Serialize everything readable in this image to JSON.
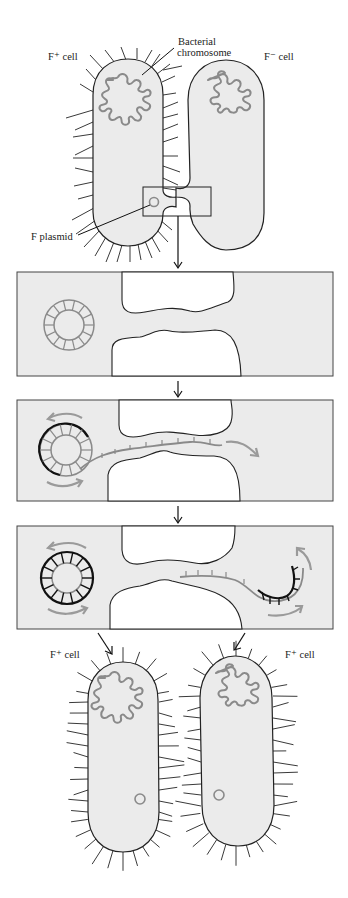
{
  "figure": {
    "colors": {
      "cell_fill": "#ebebeb",
      "outline": "#222222",
      "dna_gray": "#8a8a8a",
      "new_strand": "#111111",
      "motion_arrow": "#9a9a9a"
    }
  },
  "labels": {
    "donor_cell": "F⁺ cell",
    "recipient_cell": "F⁻ cell",
    "chromosome_line1": "Bacterial",
    "chromosome_line2": "chromosome",
    "plasmid": "F plasmid",
    "result_left": "F⁺ cell",
    "result_right": "F⁺ cell"
  },
  "stages": [
    {
      "id": "stage-1",
      "description": "Mating bridge forms; F plasmid double-stranded circle in donor"
    },
    {
      "id": "stage-2",
      "description": "One strand nicked and transferred through bridge while rolling-circle synthesis replaces it"
    },
    {
      "id": "stage-3",
      "description": "Complementary strand synthesized in recipient; both circles become double-stranded"
    },
    {
      "id": "stage-4",
      "description": "Both cells now F+ cells"
    }
  ]
}
